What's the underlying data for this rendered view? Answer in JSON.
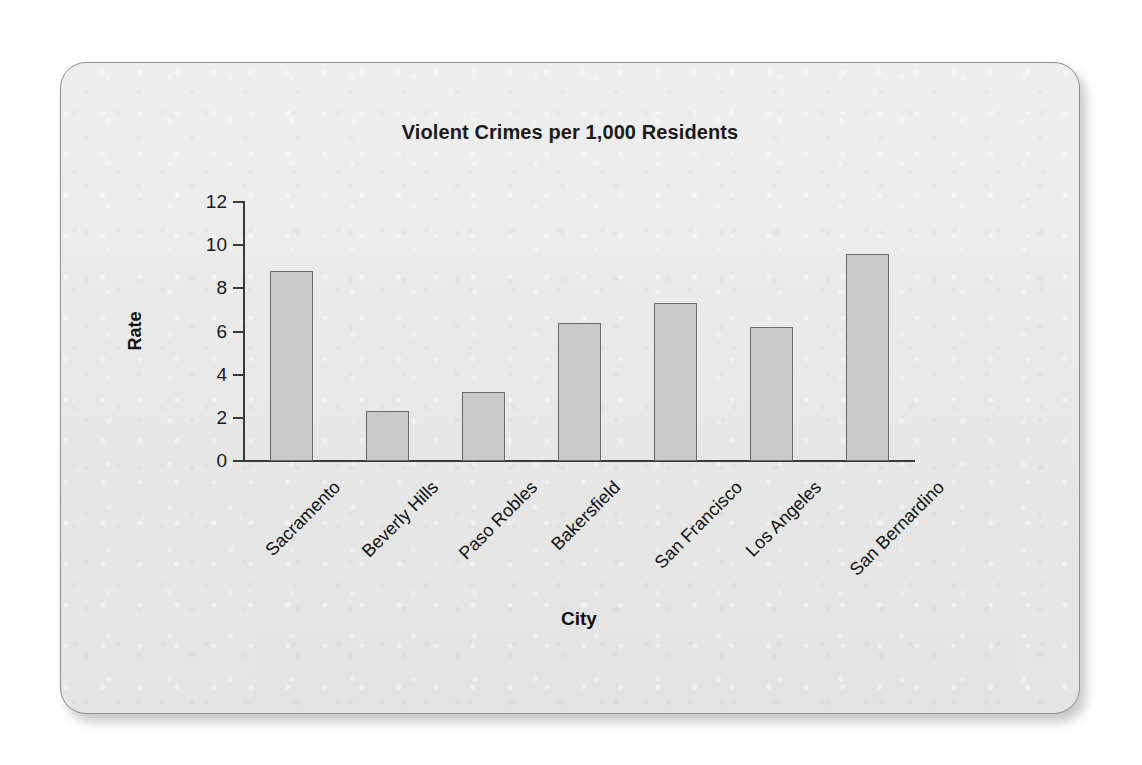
{
  "chart_data": {
    "type": "bar",
    "title": "Violent Crimes per 1,000 Residents",
    "xlabel": "City",
    "ylabel": "Rate",
    "categories": [
      "Sacramento",
      "Beverly Hills",
      "Paso Robles",
      "Bakersfield",
      "San Francisco",
      "Los Angeles",
      "San Bernardino"
    ],
    "values": [
      8.8,
      2.3,
      3.2,
      6.4,
      7.3,
      6.2,
      9.6
    ],
    "ylim": [
      0,
      12
    ],
    "yticks": [
      0,
      2,
      4,
      6,
      8,
      10,
      12
    ],
    "ytick_labels": [
      "0",
      "2",
      "4",
      "6",
      "8",
      "10",
      "12"
    ],
    "grid": false,
    "legend": false,
    "bar_color": "#c9c9c9",
    "bar_edge_color": "#6b6b6b",
    "background_color": "#e9e9e9",
    "axis_color": "#3a3a3a",
    "xtick_label_rotation": -45
  }
}
